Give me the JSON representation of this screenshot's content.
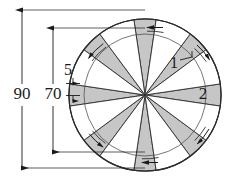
{
  "diagram": {
    "outline_color": "#2b2b2b",
    "sector_fill": "#c6c6c6",
    "gap_fill": "#ffffff",
    "background": "#ffffff",
    "circle": {
      "center_x": 145,
      "center_y": 95,
      "outer_radius": 76,
      "inner_radius": 61,
      "sector_count": 8
    },
    "dimensions": [
      {
        "name": "overall-diameter",
        "label": "90",
        "orientation": "vertical",
        "x": 22,
        "y_top": 10,
        "y_bottom": 168,
        "text_x": 22,
        "text_y": 95
      },
      {
        "name": "inner-diameter",
        "label": "70",
        "orientation": "vertical",
        "x": 53,
        "y_top": 28,
        "y_bottom": 152,
        "text_x": 53,
        "text_y": 95
      },
      {
        "name": "ring-thickness",
        "label": "5",
        "orientation": "vertical",
        "x": 73,
        "y_top": 81,
        "y_bottom": 95,
        "text_x": 68,
        "text_y": 73
      }
    ],
    "callouts": [
      {
        "name": "callout-1",
        "label": "1",
        "text_x": 177,
        "text_y": 66,
        "leader_from_x": 183,
        "leader_from_y": 62,
        "leader_to_x": 194,
        "leader_to_y": 58,
        "target": "gap-wedge"
      },
      {
        "name": "callout-2",
        "label": "2",
        "text_x": 203,
        "text_y": 95,
        "leader_from_x": null,
        "leader_from_y": null,
        "leader_to_x": null,
        "leader_to_y": null,
        "target": "shaded-sector"
      }
    ],
    "rotation_arrows": [
      {
        "name": "rotation-arrow-top",
        "angle_deg": -90,
        "direction": "counter-clockwise"
      },
      {
        "name": "rotation-arrow-upper-left",
        "angle_deg": -135,
        "direction": "counter-clockwise"
      },
      {
        "name": "rotation-arrow-lower-left",
        "angle_deg": 135,
        "direction": "counter-clockwise"
      },
      {
        "name": "rotation-arrow-bottom",
        "angle_deg": 90,
        "direction": "counter-clockwise"
      },
      {
        "name": "rotation-arrow-lower-right",
        "angle_deg": 45,
        "direction": "counter-clockwise"
      },
      {
        "name": "rotation-arrow-upper-right",
        "angle_deg": -45,
        "direction": "counter-clockwise"
      }
    ]
  }
}
